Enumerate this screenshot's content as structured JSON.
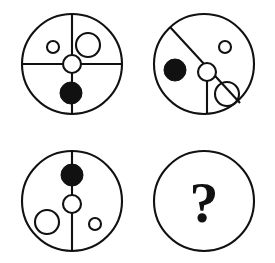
{
  "puzzle": {
    "type": "visual-analogy-matrix",
    "title": "",
    "grid": {
      "rows": 2,
      "cols": 2
    },
    "colors": {
      "ink": "#111111",
      "paper": "#ffffff",
      "filled_shape": "#111111",
      "open_shape": "#ffffff"
    },
    "panels": [
      {
        "id": "panel-1",
        "position": "top-left",
        "label": "",
        "outline": {
          "cx": 72,
          "cy": 64,
          "r": 50
        },
        "lines": [
          {
            "name": "vertical-axis",
            "x1": 72,
            "y1": 14,
            "x2": 72,
            "y2": 114
          },
          {
            "name": "horizontal-axis",
            "x1": 22,
            "y1": 64,
            "x2": 122,
            "y2": 64
          }
        ],
        "shapes": [
          {
            "name": "small-open-circle",
            "kind": "open",
            "cx": 53,
            "cy": 47,
            "r": 6
          },
          {
            "name": "large-open-circle",
            "kind": "open",
            "cx": 88,
            "cy": 45,
            "r": 12
          },
          {
            "name": "hub-circle",
            "kind": "hub",
            "cx": 72,
            "cy": 64,
            "r": 9
          },
          {
            "name": "filled-circle",
            "kind": "filled",
            "cx": 71,
            "cy": 93,
            "r": 11
          }
        ]
      },
      {
        "id": "panel-2",
        "position": "top-right",
        "label": "",
        "outline": {
          "cx": 204,
          "cy": 64,
          "r": 50
        },
        "lines": [
          {
            "name": "diagonal-axis",
            "x1": 170,
            "y1": 27,
            "x2": 240,
            "y2": 103
          },
          {
            "name": "vertical-axis",
            "x1": 207,
            "y1": 72,
            "x2": 207,
            "y2": 114
          }
        ],
        "shapes": [
          {
            "name": "filled-circle",
            "kind": "filled",
            "cx": 175,
            "cy": 70,
            "r": 11
          },
          {
            "name": "small-open-circle",
            "kind": "open",
            "cx": 225,
            "cy": 47,
            "r": 6
          },
          {
            "name": "hub-circle",
            "kind": "hub",
            "cx": 207,
            "cy": 72,
            "r": 9
          },
          {
            "name": "large-open-circle",
            "kind": "open",
            "cx": 227,
            "cy": 94,
            "r": 12
          }
        ]
      },
      {
        "id": "panel-3",
        "position": "bottom-left",
        "label": "",
        "outline": {
          "cx": 72,
          "cy": 201,
          "r": 50
        },
        "lines": [
          {
            "name": "vertical-axis",
            "x1": 72,
            "y1": 151,
            "x2": 72,
            "y2": 251
          }
        ],
        "shapes": [
          {
            "name": "filled-circle",
            "kind": "filled",
            "cx": 72,
            "cy": 175,
            "r": 11
          },
          {
            "name": "hub-circle",
            "kind": "hub",
            "cx": 72,
            "cy": 204,
            "r": 9
          },
          {
            "name": "large-open-circle",
            "kind": "open",
            "cx": 47,
            "cy": 222,
            "r": 12
          },
          {
            "name": "small-open-circle",
            "kind": "open",
            "cx": 95,
            "cy": 224,
            "r": 6
          }
        ]
      },
      {
        "id": "panel-4",
        "position": "bottom-right",
        "label": "?",
        "outline": {
          "cx": 204,
          "cy": 201,
          "r": 50
        },
        "lines": [],
        "shapes": [],
        "is_answer_slot": true
      }
    ]
  }
}
